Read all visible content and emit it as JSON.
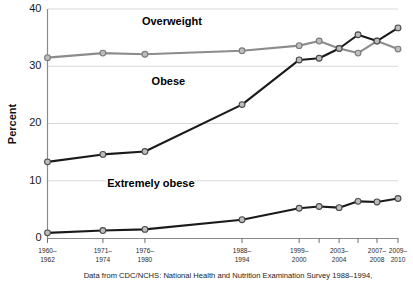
{
  "chart_data": {
    "type": "line",
    "title": "",
    "subtitle": "",
    "xlabel": "",
    "ylabel": "Percent",
    "ylim": [
      0,
      40
    ],
    "yticks": [
      0,
      10,
      20,
      30,
      40
    ],
    "ytick_labels": [
      "0",
      "10",
      "20",
      "30",
      "40"
    ],
    "grid": true,
    "grid_axis": "y",
    "legend": "inline-labels",
    "categories": [
      "1960–1962",
      "1971–1974",
      "1976–1980",
      "1988–1994",
      "1999–2000",
      "2001–2002",
      "2003–2004",
      "2005–2006",
      "2007–2008",
      "2009–2010"
    ],
    "xtick_labels": [
      "1960–\n1962",
      "1971–\n1974",
      "1976–\n1980",
      "1988–\n1994",
      "1999–\n2000",
      "",
      "2003–\n2004",
      "",
      "2007–\n2008",
      "2009–\n2010"
    ],
    "xtick_labels_line1": [
      "1960–",
      "1971–",
      "1976–",
      "1988–",
      "1999–",
      "",
      "2003–",
      "",
      "2007–",
      "2009–"
    ],
    "xtick_labels_line2": [
      "1962",
      "1974",
      "1980",
      "1994",
      "2000",
      "",
      "2004",
      "",
      "2008",
      "2010"
    ],
    "series": [
      {
        "name": "Overweight",
        "color": "#8c8c8c",
        "marker_fill": "#bdbdbd",
        "values": [
          31.5,
          32.3,
          32.1,
          32.7,
          33.6,
          34.4,
          33.1,
          32.3,
          34.4,
          33.0
        ]
      },
      {
        "name": "Obese",
        "color": "#1a1a1a",
        "marker_fill": "#bdbdbd",
        "values": [
          13.3,
          14.6,
          15.1,
          23.3,
          31.1,
          31.4,
          33.1,
          35.5,
          34.4,
          36.7
        ]
      },
      {
        "name": "Extremely obese",
        "color": "#1a1a1a",
        "marker_fill": "#bdbdbd",
        "values": [
          0.9,
          1.3,
          1.5,
          3.2,
          5.2,
          5.5,
          5.3,
          6.4,
          6.3,
          6.9
        ]
      }
    ],
    "annotations": [
      {
        "text": "Overweight",
        "x_frac": 0.355,
        "y_value": 37.3
      },
      {
        "text": "Obese",
        "x_frac": 0.345,
        "y_value": 26.8
      },
      {
        "text": "Extremely obese",
        "x_frac": 0.295,
        "y_value": 9.0
      }
    ],
    "caption": "Data from CDC/NCHS: National Health and Nutrition Examination Survey 1988–1994,"
  },
  "axis": {
    "y_title": "Percent"
  },
  "colors": {
    "overweight": "#8c8c8c",
    "obese": "#1a1a1a",
    "extremely_obese": "#1a1a1a",
    "marker_fill": "#bdbdbd",
    "marker_stroke": "#555555",
    "grid": "#d9d9d9",
    "axis": "#8a8a8a",
    "background": "#ffffff"
  }
}
